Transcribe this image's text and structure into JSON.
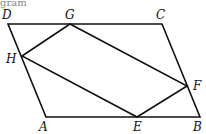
{
  "caption_fragment": "gram",
  "points": {
    "A": {
      "label": "A",
      "x": 46,
      "y": 117
    },
    "B": {
      "label": "B",
      "x": 200,
      "y": 117
    },
    "C": {
      "label": "C",
      "x": 162,
      "y": 24
    },
    "D": {
      "label": "D",
      "x": 8,
      "y": 24
    },
    "E": {
      "label": "E",
      "x": 137,
      "y": 117
    },
    "F": {
      "label": "F",
      "x": 187,
      "y": 86
    },
    "G": {
      "label": "G",
      "x": 70,
      "y": 24
    },
    "H": {
      "label": "H",
      "x": 22,
      "y": 56
    }
  },
  "shapes": [
    {
      "name": "parallelogram-ABCD",
      "vertices": [
        "A",
        "B",
        "C",
        "D"
      ]
    },
    {
      "name": "quadrilateral-EFGH",
      "vertices": [
        "E",
        "F",
        "G",
        "H"
      ]
    }
  ],
  "stroke_color": "#111111"
}
